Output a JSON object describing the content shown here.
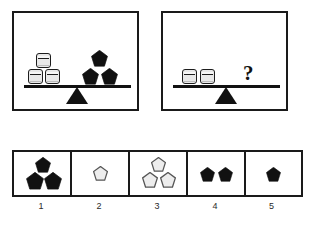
{
  "puzzle": {
    "type": "balance-scale-analogy",
    "panels": [
      {
        "id": "panel-left",
        "name": "left-balance-panel",
        "state": "balanced",
        "left_pan": {
          "object": "cylinder",
          "count": 3,
          "fill": "#e8e8e8",
          "stroke": "#1d1d1d",
          "arrangement": "2-bottom-1-top"
        },
        "right_pan": {
          "object": "pentagon",
          "count": 3,
          "fill": "#111111",
          "stroke": "#111111",
          "arrangement": "2-bottom-1-top"
        }
      },
      {
        "id": "panel-right",
        "name": "right-balance-panel",
        "state": "balanced",
        "left_pan": {
          "object": "cylinder",
          "count": 2,
          "fill": "#e8e8e8",
          "stroke": "#1d1d1d",
          "arrangement": "1-row"
        },
        "right_pan": {
          "object": "question-mark",
          "count": 1,
          "label": "?"
        }
      }
    ],
    "options": [
      {
        "number": "1",
        "label": "1",
        "object": "pentagon",
        "count": 3,
        "fill": "#111111",
        "stroke": "#111111",
        "arrangement": "1-top-2-bottom"
      },
      {
        "number": "2",
        "label": "2",
        "object": "pentagon",
        "count": 1,
        "fill": "#ededed",
        "stroke": "#555555",
        "arrangement": "single"
      },
      {
        "number": "3",
        "label": "3",
        "object": "pentagon",
        "count": 3,
        "fill": "#ededed",
        "stroke": "#555555",
        "arrangement": "1-top-2-bottom"
      },
      {
        "number": "4",
        "label": "4",
        "object": "pentagon",
        "count": 2,
        "fill": "#111111",
        "stroke": "#111111",
        "arrangement": "1-row"
      },
      {
        "number": "5",
        "label": "5",
        "object": "pentagon",
        "count": 1,
        "fill": "#111111",
        "stroke": "#111111",
        "arrangement": "single"
      }
    ],
    "colors": {
      "ink": "#1a1a1a",
      "background": "#ffffff",
      "solid_shape": "#111111",
      "hollow_shape_fill": "#ededed",
      "cylinder_fill": "#e8e8e8"
    }
  }
}
